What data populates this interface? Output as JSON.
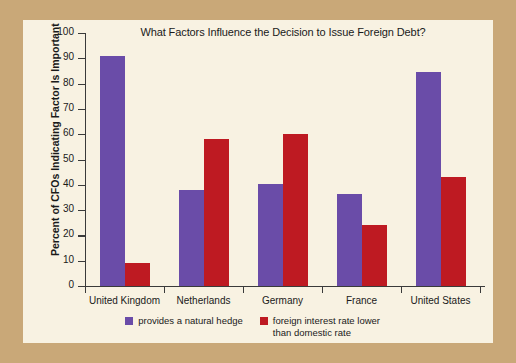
{
  "figure": {
    "background_outer": "#c9a878",
    "background_panel": "#f8f2e2"
  },
  "chart_data": {
    "type": "bar",
    "title": "What Factors Influence the Decision to Issue Foreign Debt?",
    "xlabel": "",
    "ylabel": "Percent of CFOs Indicating Factor Is Important",
    "ylim": [
      0,
      100
    ],
    "yticks": [
      0,
      10,
      20,
      30,
      40,
      50,
      60,
      70,
      80,
      90,
      100
    ],
    "ytick_labels": [
      "0",
      "10",
      "20",
      "30",
      "40",
      "50",
      "60",
      "70",
      "80",
      "90",
      "100"
    ],
    "grid": false,
    "legend_position": "bottom-center",
    "categories": [
      "United Kingdom",
      "Netherlands",
      "Germany",
      "France",
      "United States"
    ],
    "series": [
      {
        "name": "provides a natural hedge",
        "color": "#6a4ca8",
        "values": [
          91,
          38,
          40.5,
          36.5,
          84.5
        ]
      },
      {
        "name": "foreign interest rate lower than domestic rate",
        "color": "#be1a22",
        "values": [
          9,
          58,
          60,
          24,
          43
        ]
      }
    ]
  },
  "legend": {
    "entries": [
      {
        "label": "provides a natural hedge"
      },
      {
        "label": "foreign interest rate lower than domestic rate"
      }
    ]
  }
}
